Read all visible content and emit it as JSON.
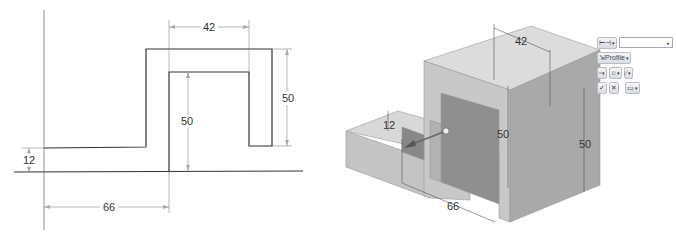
{
  "sketch_2d": {
    "dimensions": {
      "base_height": "12",
      "offset_width": "66",
      "opening_width": "42",
      "opening_height": "50",
      "leg_height": "50"
    }
  },
  "model_3d": {
    "dimensions": {
      "base_height": "12",
      "offset_width": "66",
      "opening_width": "42",
      "opening_height": "50",
      "block_height": "50"
    }
  },
  "extrude_toolbar": {
    "distance_type_icon": "distance-icon",
    "distance_value": "",
    "profile_label": "Profile",
    "confirm_label": "✓",
    "cancel_label": "✕",
    "colors": {
      "face_top": "#dcdcdc",
      "face_left": "#c9c9c9",
      "face_right": "#a8a8a8"
    }
  }
}
